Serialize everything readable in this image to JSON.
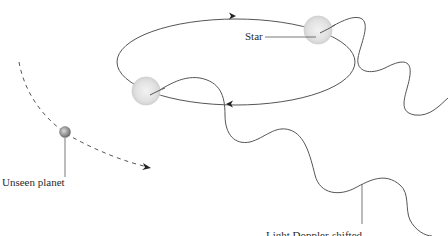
{
  "diagram": {
    "labels": {
      "star": "Star",
      "planet": "Unseen planet",
      "light": "Light Doppler-shifted"
    },
    "elements": {
      "star_orbit": "elliptical orbit of star with direction arrows",
      "star_positions": 2,
      "planet_orbit": "dashed arc with arrow",
      "light_waves": 2
    },
    "colors": {
      "line": "#555555",
      "star_fill": "#e6e6e6",
      "planet_fill": "#9a9a9a",
      "text": "#2b2b2b",
      "background": "#ffffff"
    }
  }
}
